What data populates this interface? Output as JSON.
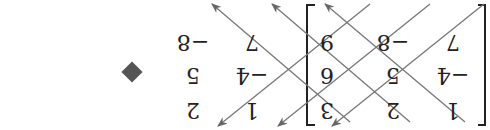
{
  "figure": {
    "rotation_deg": 180,
    "matrix": [
      [
        "1",
        "2",
        "3"
      ],
      [
        "−4",
        "5",
        "6"
      ],
      [
        "7",
        "−8",
        "9"
      ]
    ],
    "repeated_columns": [
      [
        "1",
        "2"
      ],
      [
        "−4",
        "5"
      ],
      [
        "7",
        "−8"
      ]
    ],
    "marker": "diamond-bullet",
    "colors": {
      "text": "#222222",
      "lines": "#777777",
      "bracket": "#222222",
      "marker": "#555555"
    }
  }
}
